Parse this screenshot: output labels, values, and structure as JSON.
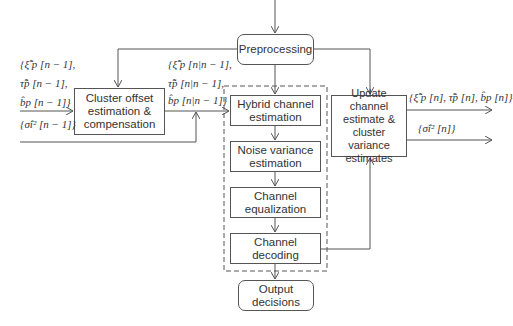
{
  "diagram": {
    "type": "block-diagram",
    "nodes": {
      "preprocessing": {
        "label": "Preprocessing"
      },
      "cluster_offset": {
        "label": "Cluster offset\nestimation &\ncompensation"
      },
      "hybrid": {
        "label": "Hybrid channel\nestimation"
      },
      "noise": {
        "label": "Noise variance\nestimation"
      },
      "equalization": {
        "label": "Channel\nequalization"
      },
      "decoding": {
        "label": "Channel\ndecoding"
      },
      "output": {
        "label": "Output\ndecisions"
      },
      "update": {
        "label": "Update channel\nestimate &\ncluster variance\nestimates"
      }
    },
    "labels": {
      "input_1": "{ξ̂̃ p [n − 1],",
      "input_2": "τ̂̃p [n − 1],",
      "input_3": "b̂p [n − 1]}",
      "input_4": "{σ̂i² [n − 1]}",
      "mid_1": "{ξ̂̃ p [n|n − 1],",
      "mid_2": "τ̂̃p [n|n − 1],",
      "mid_3": "b̂p [n|n − 1]}",
      "out_1": "{ξ̂̃ p [n], τ̂̃p [n], b̂p [n]}",
      "out_2": "{σ̂i² [n]}"
    },
    "edges": [
      {
        "from": "input",
        "to": "preprocessing"
      },
      {
        "from": "preprocessing",
        "to": "cluster_offset"
      },
      {
        "from": "preprocessing",
        "to": "hybrid"
      },
      {
        "from": "preprocessing",
        "to": "update"
      },
      {
        "from": "cluster_offset",
        "to": "hybrid"
      },
      {
        "from": "hybrid",
        "to": "noise"
      },
      {
        "from": "noise",
        "to": "equalization"
      },
      {
        "from": "equalization",
        "to": "decoding"
      },
      {
        "from": "decoding",
        "to": "output"
      },
      {
        "from": "decoding",
        "to": "update"
      }
    ]
  }
}
